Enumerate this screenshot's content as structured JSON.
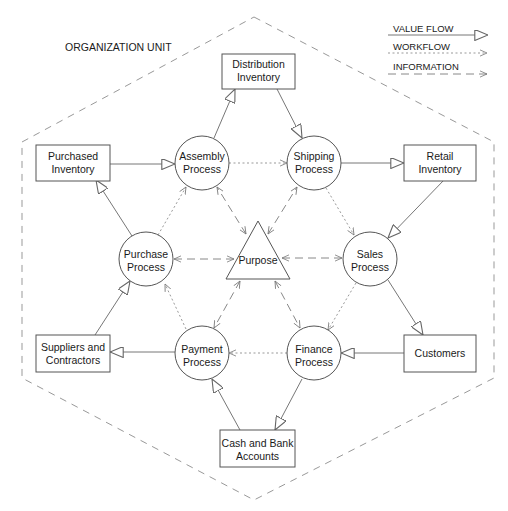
{
  "diagram": {
    "boundary_label": "ORGANIZATION UNIT",
    "legend": [
      {
        "label": "VALUE FLOW",
        "style": "solid-hollow-arrow"
      },
      {
        "label": "WORKFLOW",
        "style": "dotted-open-arrow"
      },
      {
        "label": "INFORMATION",
        "style": "dashed-open-arrow"
      }
    ],
    "center": {
      "id": "purpose",
      "label": "Purpose",
      "shape": "triangle"
    },
    "processes": [
      {
        "id": "assembly",
        "line1": "Assembly",
        "line2": "Process"
      },
      {
        "id": "shipping",
        "line1": "Shipping",
        "line2": "Process"
      },
      {
        "id": "purchase",
        "line1": "Purchase",
        "line2": "Process"
      },
      {
        "id": "sales",
        "line1": "Sales",
        "line2": "Process"
      },
      {
        "id": "payment",
        "line1": "Payment",
        "line2": "Process"
      },
      {
        "id": "finance",
        "line1": "Finance",
        "line2": "Process"
      }
    ],
    "resources": [
      {
        "id": "distribution_inventory",
        "line1": "Distribution",
        "line2": "Inventory"
      },
      {
        "id": "purchased_inventory",
        "line1": "Purchased",
        "line2": "Inventory"
      },
      {
        "id": "retail_inventory",
        "line1": "Retail",
        "line2": "Inventory"
      },
      {
        "id": "suppliers",
        "line1": "Suppliers and",
        "line2": "Contractors"
      },
      {
        "id": "customers",
        "line1": "Customers",
        "line2": ""
      },
      {
        "id": "cash_bank",
        "line1": "Cash and Bank",
        "line2": "Accounts"
      }
    ],
    "value_flows": [
      [
        "Purchased Inventory",
        "Assembly Process"
      ],
      [
        "Assembly Process",
        "Distribution Inventory"
      ],
      [
        "Distribution Inventory",
        "Shipping Process"
      ],
      [
        "Shipping Process",
        "Retail Inventory"
      ],
      [
        "Retail Inventory",
        "Sales Process"
      ],
      [
        "Sales Process",
        "Customers"
      ],
      [
        "Customers",
        "Finance Process"
      ],
      [
        "Finance Process",
        "Cash and Bank Accounts"
      ],
      [
        "Cash and Bank Accounts",
        "Payment Process"
      ],
      [
        "Payment Process",
        "Suppliers and Contractors"
      ],
      [
        "Suppliers and Contractors",
        "Purchase Process"
      ],
      [
        "Purchase Process",
        "Purchased Inventory"
      ]
    ],
    "workflows": [
      [
        "Purchase Process",
        "Assembly Process"
      ],
      [
        "Assembly Process",
        "Shipping Process"
      ],
      [
        "Shipping Process",
        "Sales Process"
      ],
      [
        "Sales Process",
        "Finance Process"
      ],
      [
        "Finance Process",
        "Payment Process"
      ],
      [
        "Payment Process",
        "Purchase Process"
      ]
    ],
    "information_flows": [
      [
        "Purpose",
        "Assembly Process"
      ],
      [
        "Purpose",
        "Shipping Process"
      ],
      [
        "Purpose",
        "Purchase Process"
      ],
      [
        "Purpose",
        "Sales Process"
      ],
      [
        "Purpose",
        "Payment Process"
      ],
      [
        "Purpose",
        "Finance Process"
      ]
    ]
  }
}
